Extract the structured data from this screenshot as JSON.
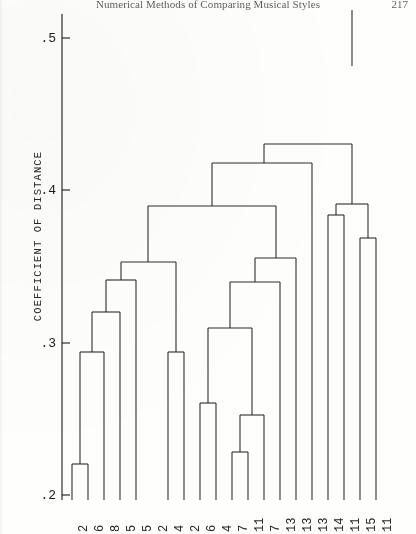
{
  "header": {
    "running_title": "Numerical Methods of Comparing Musical Styles",
    "page_number": "217"
  },
  "axis": {
    "y_title": "COEFFICIENT OF DISTANCE",
    "y_ticks": [
      {
        "label": ".5",
        "value": 0.5,
        "y": 38
      },
      {
        "label": ".4",
        "value": 0.4,
        "y": 190
      },
      {
        "label": ".3",
        "value": 0.3,
        "y": 343
      },
      {
        "label": ".2",
        "value": 0.2,
        "y": 495
      }
    ],
    "y_min": 0.2,
    "y_max": 0.52
  },
  "chart_data": {
    "type": "dendrogram",
    "title": "",
    "xlabel": "",
    "ylabel": "COEFFICIENT OF DISTANCE",
    "ylim": [
      0.2,
      0.52
    ],
    "grid": false,
    "legend": "none",
    "axis_orientation": "vertical-merge-height",
    "leaf_labels": [
      "2",
      "6",
      "8",
      "5",
      "5",
      "2",
      "4",
      "2",
      "6",
      "4",
      "7",
      "11",
      "7",
      "13",
      "13",
      "13",
      "14",
      "11",
      "15",
      "11"
    ],
    "leaf_x": [
      72,
      88,
      104,
      120,
      136,
      152,
      168,
      184,
      200,
      216,
      232,
      248,
      264,
      280,
      296,
      312,
      328,
      344,
      360,
      376
    ],
    "merges": [
      {
        "id": "m1",
        "left": "leaf0",
        "right": "leaf1",
        "height": 0.2295,
        "y": 464,
        "x": 80
      },
      {
        "id": "m2",
        "left": "m1",
        "right": "leaf2",
        "height": 0.2965,
        "y": 352,
        "x": 92
      },
      {
        "id": "m3",
        "left": "m2",
        "right": "leaf3",
        "height": 0.3235,
        "y": 312,
        "x": 106
      },
      {
        "id": "m4",
        "left": "m3",
        "right": "leaf4",
        "height": 0.344,
        "y": 280,
        "x": 121
      },
      {
        "id": "m5",
        "left": "leaf6",
        "right": "leaf7",
        "height": 0.2965,
        "y": 352,
        "x": 176
      },
      {
        "id": "m6",
        "left": "m4",
        "right": "m5",
        "height": 0.353,
        "y": 262,
        "x": 148
      },
      {
        "id": "m7",
        "left": "leaf8",
        "right": "leaf9",
        "height": 0.267,
        "y": 403,
        "x": 208
      },
      {
        "id": "m8",
        "left": "leaf10",
        "right": "leaf11",
        "height": 0.2365,
        "y": 452,
        "x": 240
      },
      {
        "id": "m9",
        "left": "m8",
        "right": "leaf12",
        "height": 0.257,
        "y": 415,
        "x": 252
      },
      {
        "id": "m10",
        "left": "m7",
        "right": "m9",
        "height": 0.2815,
        "y": 328,
        "x": 230
      },
      {
        "id": "m11",
        "left": "m10",
        "right": "leaf13",
        "height": 0.343,
        "y": 282,
        "x": 255
      },
      {
        "id": "m12",
        "left": "m11",
        "right": "leaf14",
        "height": 0.3585,
        "y": 258,
        "x": 276
      },
      {
        "id": "m13",
        "left": "m6",
        "right": "m12",
        "height": 0.39,
        "y": 206,
        "x": 212
      },
      {
        "id": "m14",
        "left": "leaf16",
        "right": "leaf17",
        "height": 0.384,
        "y": 215,
        "x": 336
      },
      {
        "id": "m15",
        "left": "leaf18",
        "right": "leaf19",
        "height": 0.369,
        "y": 238,
        "x": 368
      },
      {
        "id": "m16",
        "left": "m14",
        "right": "m15",
        "height": 0.3905,
        "y": 204,
        "x": 352
      },
      {
        "id": "m17",
        "left": "m13",
        "right": "leaf15",
        "height": 0.4175,
        "y": 163,
        "x": 264
      },
      {
        "id": "m18",
        "left": "m17",
        "right": "m16",
        "height": 0.4295,
        "y": 144,
        "x": 308
      },
      {
        "id": "m19",
        "left": "m18",
        "right": "root_r",
        "height": 0.4805,
        "y": 66,
        "x": 352
      }
    ],
    "root": {
      "height": 0.5205,
      "y": 16,
      "x": 360
    }
  },
  "colors": {
    "ink": "#1c1c1a",
    "paper": "#fefefd",
    "line": "#2d2d2b"
  }
}
